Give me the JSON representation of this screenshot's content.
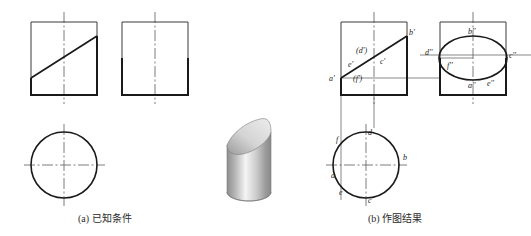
{
  "figure": {
    "captions": {
      "left": "(a) 已知条件",
      "right": "(b) 作图结果"
    }
  },
  "colors": {
    "outline": "#1a1a1a",
    "thin_line": "#4a4a4a",
    "center_line": "#5a5a5a",
    "projection_line": "#555555",
    "label_text": "#222222",
    "caption_text": "#2b2b2b",
    "solid_light": "#f2f2f2",
    "solid_mid": "#c9c9c9",
    "solid_dark": "#8e8e8e",
    "solid_face_light": "#e8e8e8",
    "solid_face_dark": "#9b9b9b"
  },
  "panel_a": {
    "name": "已知条件",
    "views": {
      "front": {
        "label": "front-view-given",
        "box": {
          "x": 31,
          "y": 22,
          "w": 66,
          "h": 73
        },
        "cut_line": {
          "x1": 31,
          "y1": 78,
          "x2": 97,
          "y2": 36
        },
        "center_line_x": 64
      },
      "side": {
        "label": "side-view-given",
        "box": {
          "x": 122,
          "y": 22,
          "w": 66,
          "h": 73
        },
        "center_line_x": 155
      },
      "top": {
        "label": "top-view-given",
        "circle": {
          "cx": 64,
          "cy": 165,
          "r": 33
        }
      }
    }
  },
  "solid": {
    "label": "truncated-cylinder-3d",
    "description": "cylinder with oblique elliptical cut face, shaded"
  },
  "panel_b": {
    "name": "作图结果",
    "views": {
      "front": {
        "label": "front-view-result",
        "box": {
          "x": 341,
          "y": 22,
          "w": 66,
          "h": 73
        },
        "cut_line": {
          "x1": 341,
          "y1": 78,
          "x2": 407,
          "y2": 36
        },
        "center_line_x": 374,
        "points": [
          {
            "id": "a-prime",
            "text": "a'",
            "x": 329,
            "y": 81
          },
          {
            "id": "e-prime",
            "text": "e'",
            "x": 348,
            "y": 67
          },
          {
            "id": "d-prime",
            "text": "(d')",
            "x": 356,
            "y": 53
          },
          {
            "id": "f-prime",
            "text": "(f')",
            "x": 353,
            "y": 81
          },
          {
            "id": "c-prime",
            "text": "c'",
            "x": 380,
            "y": 64
          },
          {
            "id": "b-prime",
            "text": "b'",
            "x": 409,
            "y": 35
          }
        ]
      },
      "side": {
        "label": "side-view-result",
        "box": {
          "x": 440,
          "y": 22,
          "w": 66,
          "h": 73
        },
        "ellipse": {
          "cx": 473,
          "cy": 58,
          "rx": 34,
          "ry": 22
        },
        "center_line_x": 473,
        "points": [
          {
            "id": "b-dprime",
            "text": "b''",
            "x": 468,
            "y": 34
          },
          {
            "id": "d-dprime",
            "text": "d''",
            "x": 427,
            "y": 55
          },
          {
            "id": "c-dprime",
            "text": "c''",
            "x": 509,
            "y": 58
          },
          {
            "id": "f-dprime",
            "text": "f''",
            "x": 448,
            "y": 66
          },
          {
            "id": "a-dprime",
            "text": "a''",
            "x": 470,
            "y": 86
          },
          {
            "id": "e-dprime",
            "text": "e''",
            "x": 489,
            "y": 85
          }
        ]
      },
      "top": {
        "label": "top-view-result",
        "circle": {
          "cx": 366,
          "cy": 165,
          "r": 33
        },
        "points": [
          {
            "id": "f-point",
            "text": "f",
            "x": 338,
            "y": 140
          },
          {
            "id": "d-point",
            "text": "d",
            "x": 369,
            "y": 132
          },
          {
            "id": "b-point",
            "text": "b",
            "x": 404,
            "y": 158
          },
          {
            "id": "a-point",
            "text": "a",
            "x": 331,
            "y": 177
          },
          {
            "id": "e-point",
            "text": "e",
            "x": 340,
            "y": 194
          },
          {
            "id": "c-point",
            "text": "c",
            "x": 369,
            "y": 201
          }
        ]
      }
    }
  }
}
